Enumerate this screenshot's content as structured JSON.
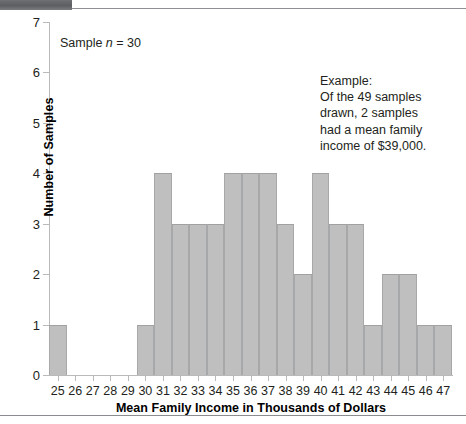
{
  "chart_data": {
    "type": "bar",
    "title": "",
    "xlabel": "Mean Family Income in Thousands of Dollars",
    "ylabel": "Number of Samples",
    "categories": [
      25,
      26,
      27,
      28,
      29,
      30,
      31,
      32,
      33,
      34,
      35,
      36,
      37,
      38,
      39,
      40,
      41,
      42,
      43,
      44,
      45,
      46,
      47
    ],
    "values": [
      1,
      0,
      0,
      0,
      0,
      1,
      4,
      3,
      3,
      3,
      4,
      4,
      4,
      3,
      2,
      4,
      3,
      3,
      1,
      2,
      2,
      1,
      1
    ],
    "ylim": [
      0,
      7
    ],
    "y_ticks": [
      0,
      1,
      2,
      3,
      4,
      5,
      6,
      7
    ],
    "x_tick_labels": [
      "25",
      "26",
      "27",
      "28",
      "29",
      "30",
      "31",
      "32",
      "33",
      "34",
      "35",
      "36",
      "37",
      "38",
      "39",
      "40",
      "41",
      "42",
      "43",
      "44",
      "45",
      "46",
      "47"
    ],
    "grid": false,
    "legend": "none",
    "bar_color": "#bfbfbf",
    "bar_edge_color": "#a7a8aa",
    "axis_color": "#b9babc",
    "text_color": "#231f20",
    "total_samples": 49,
    "annotations": [
      {
        "name": "sample-size-note",
        "text_prefix": "Sample ",
        "italic_symbol": "n",
        "text_suffix": " = 30"
      },
      {
        "name": "example-callout",
        "lines": [
          "Example:",
          "Of the 49 samples",
          "drawn, 2 samples",
          "had a mean family",
          "income of $39,000."
        ]
      }
    ]
  }
}
